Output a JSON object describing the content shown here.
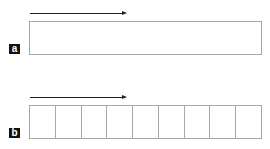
{
  "panels": [
    {
      "label": "a",
      "cells": 1,
      "arrow": "left-to-right"
    },
    {
      "label": "b",
      "cells": 9,
      "arrow": "left-to-right"
    }
  ],
  "colors": {
    "arrow": "#222222",
    "box_border": "#a8a8a8",
    "label_bg": "#111111",
    "label_text": "#ffffff"
  }
}
